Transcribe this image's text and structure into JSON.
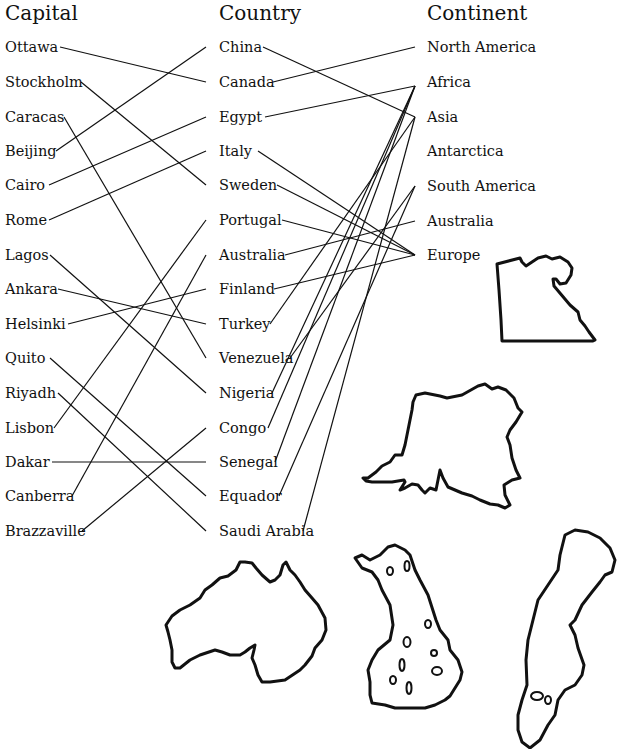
{
  "headers": {
    "capital": "Capital",
    "country": "Country",
    "continent": "Continent"
  },
  "capitals": [
    {
      "label": "Ottawa",
      "y": 47
    },
    {
      "label": "Stockholm",
      "y": 82
    },
    {
      "label": "Caracas",
      "y": 117
    },
    {
      "label": "Beijing",
      "y": 151
    },
    {
      "label": "Cairo",
      "y": 185
    },
    {
      "label": "Rome",
      "y": 220
    },
    {
      "label": "Lagos",
      "y": 255
    },
    {
      "label": "Ankara",
      "y": 289
    },
    {
      "label": "Helsinki",
      "y": 324
    },
    {
      "label": "Quito",
      "y": 358
    },
    {
      "label": "Riyadh",
      "y": 393
    },
    {
      "label": "Lisbon",
      "y": 428
    },
    {
      "label": "Dakar",
      "y": 462
    },
    {
      "label": "Canberra",
      "y": 496
    },
    {
      "label": "Brazzaville",
      "y": 531
    }
  ],
  "countries": [
    {
      "label": "China",
      "y": 47
    },
    {
      "label": "Canada",
      "y": 82
    },
    {
      "label": "Egypt",
      "y": 117
    },
    {
      "label": "Italy",
      "y": 151
    },
    {
      "label": "Sweden",
      "y": 185
    },
    {
      "label": "Portugal",
      "y": 220
    },
    {
      "label": "Australia",
      "y": 255
    },
    {
      "label": "Finland",
      "y": 289
    },
    {
      "label": "Turkey",
      "y": 324
    },
    {
      "label": "Venezuela",
      "y": 358
    },
    {
      "label": "Nigeria",
      "y": 393
    },
    {
      "label": "Congo",
      "y": 428
    },
    {
      "label": "Senegal",
      "y": 462
    },
    {
      "label": "Equador",
      "y": 496
    },
    {
      "label": "Saudi Arabia",
      "y": 531
    }
  ],
  "continents": [
    {
      "label": "North America",
      "y": 47
    },
    {
      "label": "Africa",
      "y": 82
    },
    {
      "label": "Asia",
      "y": 117
    },
    {
      "label": "Antarctica",
      "y": 151
    },
    {
      "label": "South America",
      "y": 186
    },
    {
      "label": "Australia",
      "y": 221
    },
    {
      "label": "Europe",
      "y": 255
    }
  ],
  "capital_to_country": [
    {
      "capital": "Ottawa",
      "country": "Canada"
    },
    {
      "capital": "Stockholm",
      "country": "Sweden"
    },
    {
      "capital": "Caracas",
      "country": "Venezuela"
    },
    {
      "capital": "Beijing",
      "country": "China"
    },
    {
      "capital": "Cairo",
      "country": "Egypt"
    },
    {
      "capital": "Rome",
      "country": "Italy"
    },
    {
      "capital": "Lagos",
      "country": "Nigeria"
    },
    {
      "capital": "Ankara",
      "country": "Turkey"
    },
    {
      "capital": "Helsinki",
      "country": "Finland"
    },
    {
      "capital": "Quito",
      "country": "Equador"
    },
    {
      "capital": "Riyadh",
      "country": "Saudi Arabia"
    },
    {
      "capital": "Lisbon",
      "country": "Portugal"
    },
    {
      "capital": "Dakar",
      "country": "Senegal"
    },
    {
      "capital": "Canberra",
      "country": "Australia"
    },
    {
      "capital": "Brazzaville",
      "country": "Congo"
    }
  ],
  "country_to_continent": [
    {
      "country": "China",
      "continent": "Asia"
    },
    {
      "country": "Canada",
      "continent": "North America"
    },
    {
      "country": "Egypt",
      "continent": "Africa"
    },
    {
      "country": "Italy",
      "continent": "Europe"
    },
    {
      "country": "Sweden",
      "continent": "Europe"
    },
    {
      "country": "Portugal",
      "continent": "Europe"
    },
    {
      "country": "Australia",
      "continent": "Australia"
    },
    {
      "country": "Finland",
      "continent": "Europe"
    },
    {
      "country": "Turkey",
      "continent": "Asia"
    },
    {
      "country": "Venezuela",
      "continent": "South America"
    },
    {
      "country": "Nigeria",
      "continent": "Africa"
    },
    {
      "country": "Congo",
      "continent": "Africa"
    },
    {
      "country": "Senegal",
      "continent": "Africa"
    },
    {
      "country": "Equador",
      "continent": "South America"
    },
    {
      "country": "Saudi Arabia",
      "continent": "Asia"
    }
  ],
  "map_outlines": [
    "egypt-outline",
    "congo-outline",
    "australia-outline",
    "finland-outline",
    "sweden-outline"
  ],
  "colors": {
    "ink": "#111111",
    "paper": "#ffffff"
  }
}
